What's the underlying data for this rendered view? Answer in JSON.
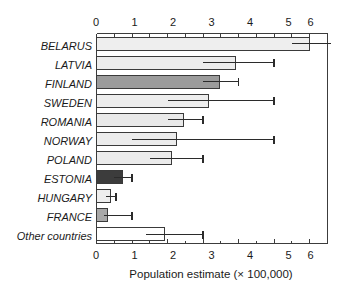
{
  "chart_data": {
    "type": "bar",
    "orientation": "horizontal",
    "title": "",
    "subtitle": "",
    "xlabel": "Population estimate (× 100,000)",
    "ylabel": "",
    "xlim": [
      0,
      6.5
    ],
    "xticks": [
      0,
      1,
      2,
      3,
      4,
      5,
      6
    ],
    "xtick_labels": [
      "0",
      "1",
      "2",
      "3",
      "4",
      "5",
      "6"
    ],
    "minor_tick_step": 0.5,
    "top_axis": true,
    "bottom_axis": true,
    "grid": false,
    "legend": "none",
    "categories": [
      "BELARUS",
      "LATVIA",
      "FINLAND",
      "SWEDEN",
      "ROMANIA",
      "NORWAY",
      "POLAND",
      "ESTONIA",
      "HUNGARY",
      "FRANCE",
      "Other countries"
    ],
    "values": [
      6.0,
      3.9,
      3.45,
      3.15,
      2.45,
      2.25,
      2.1,
      0.72,
      0.38,
      0.32,
      1.92
    ],
    "error_low": [
      5.5,
      3.0,
      3.0,
      2.0,
      2.0,
      1.0,
      1.5,
      0.5,
      0.28,
      0.2,
      1.4
    ],
    "error_high": [
      6.6,
      5.0,
      4.0,
      5.0,
      3.0,
      5.0,
      3.0,
      1.0,
      0.55,
      1.0,
      3.0
    ],
    "bar_colors": [
      "#eeeeee",
      "#ececec",
      "#9b9b9b",
      "#ededed",
      "#e9e9e9",
      "#ececec",
      "#ebebeb",
      "#3c3c3c",
      "#eeeeee",
      "#a8a8a8",
      "#ffffff"
    ],
    "bar_edge_color": "#3a3a3a",
    "error_bar_color": "#2b2b2b",
    "axis_color": "#3c3c3c",
    "background_color": "#ffffff"
  },
  "labels": {
    "c0": "BELARUS",
    "c1": "LATVIA",
    "c2": "FINLAND",
    "c3": "SWEDEN",
    "c4": "ROMANIA",
    "c5": "NORWAY",
    "c6": "POLAND",
    "c7": "ESTONIA",
    "c8": "HUNGARY",
    "c9": "FRANCE",
    "c10": "Other countries"
  },
  "ticks": {
    "t0": "0",
    "t1": "1",
    "t2": "2",
    "t3": "3",
    "t4": "4",
    "t5": "5",
    "t6": "6"
  },
  "axis": {
    "x_title": "Population estimate (× 100,000)"
  }
}
